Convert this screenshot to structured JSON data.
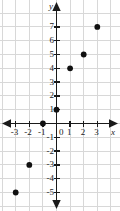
{
  "chart_data": {
    "type": "scatter",
    "title": "",
    "xlabel": "x",
    "ylabel": "y",
    "xlim": [
      -3.8,
      3.8
    ],
    "ylim": [
      -5.8,
      7.8
    ],
    "grid": true,
    "legend": false,
    "x_ticks": [
      -3,
      -2,
      -1,
      0,
      1,
      2,
      3
    ],
    "x_tick_labels": [
      "-3",
      "-2",
      "-1",
      "0",
      "1",
      "2",
      "3"
    ],
    "y_ticks": [
      -5,
      -4,
      -3,
      -2,
      -1,
      1,
      2,
      3,
      4,
      5,
      6,
      7
    ],
    "y_tick_labels": [
      "-5",
      "-4",
      "-3",
      "-2",
      "-1",
      "1",
      "2",
      "3",
      "4",
      "5",
      "6",
      "7"
    ],
    "points": [
      {
        "x": -3,
        "y": -5
      },
      {
        "x": -2,
        "y": -3
      },
      {
        "x": -1,
        "y": 0
      },
      {
        "x": 0,
        "y": 1
      },
      {
        "x": 1,
        "y": 4
      },
      {
        "x": 2,
        "y": 5
      },
      {
        "x": 3,
        "y": 7
      }
    ],
    "point_color": "#111111",
    "grid_color": "#d8d8d8",
    "axis_color": "#1a1a1a"
  }
}
